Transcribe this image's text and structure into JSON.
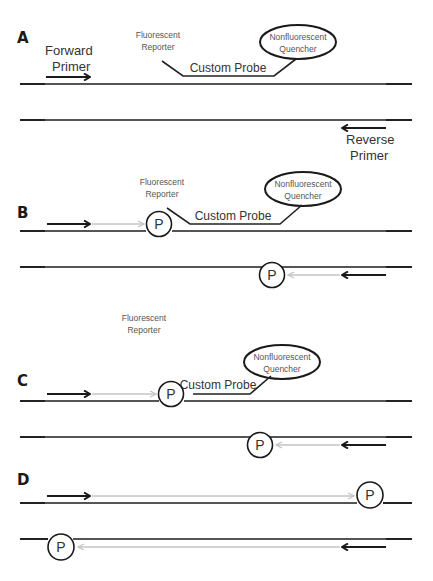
{
  "colors": {
    "strand_dark": "#222222",
    "strand_mid": "#555555",
    "extension_grey": "#c4c4c4",
    "text": "#333333"
  },
  "labels": {
    "forward_primer_line1": "Forward",
    "forward_primer_line2": "Primer",
    "reverse_primer_line1": "Reverse",
    "reverse_primer_line2": "Primer",
    "reporter_line1": "Fluorescent",
    "reporter_line2": "Reporter",
    "quencher_line1": "Nonfluorescent",
    "quencher_line2": "Quencher",
    "custom_probe": "Custom Probe",
    "polymerase": "P"
  },
  "panels": [
    {
      "id": "A",
      "label": "A",
      "description": "Primers and probe anneal to template strands"
    },
    {
      "id": "B",
      "label": "B",
      "description": "Polymerase extends primers toward the probe"
    },
    {
      "id": "C",
      "label": "C",
      "description": "Polymerase cleaves reporter from probe; reporter released"
    },
    {
      "id": "D",
      "label": "D",
      "description": "Extension completes across full template"
    }
  ]
}
